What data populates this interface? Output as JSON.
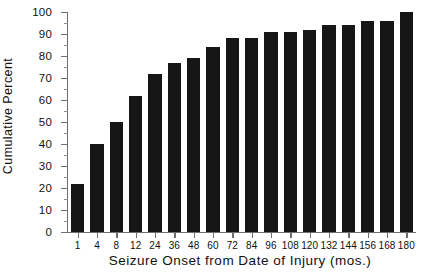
{
  "chart_data": {
    "type": "bar",
    "title": "",
    "xlabel": "Seizure Onset from Date of Injury (mos.)",
    "ylabel": "Cumulative Percent",
    "categories": [
      "1",
      "4",
      "8",
      "12",
      "24",
      "36",
      "48",
      "60",
      "72",
      "84",
      "96",
      "108",
      "120",
      "132",
      "144",
      "156",
      "168",
      "180"
    ],
    "values": [
      22,
      40,
      50,
      62,
      72,
      77,
      79,
      84,
      88,
      88,
      91,
      91,
      92,
      94,
      94,
      96,
      96,
      100
    ],
    "ylim": [
      0,
      100
    ],
    "yticks": [
      0,
      10,
      20,
      30,
      40,
      50,
      60,
      70,
      80,
      90,
      100
    ],
    "ytick_labels": [
      "0",
      "10",
      "20",
      "30",
      "40",
      "50",
      "60",
      "70",
      "80",
      "90",
      "100"
    ],
    "y_minor_step": 5,
    "grid": false,
    "legend": null,
    "bar_color": "#161616",
    "axis_color": "#6f6f6f",
    "background": "#ffffff"
  }
}
